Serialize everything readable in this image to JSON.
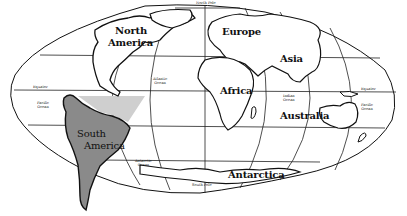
{
  "map": {
    "projection": "oval world map",
    "highlight_colors": {
      "south_america": "#8a8a8a",
      "atlantic_region": "#cfcfcf",
      "outline": "#111111",
      "background": "#ffffff"
    },
    "continent_labels": {
      "north_america_1": "North",
      "north_america_2": "America",
      "europe": "Europe",
      "asia": "Asia",
      "africa": "Africa",
      "australia": "Australia",
      "south_america_1": "South",
      "south_america_2": "America",
      "antarctica": "Antarctica"
    },
    "small_labels": {
      "north_pole": "North Pole",
      "south_pole": "South Pole",
      "equator_left": "Equator",
      "equator_right": "Equator",
      "pacific_left_1": "Pacific",
      "pacific_left_2": "Ocean",
      "pacific_right_1": "Pacific",
      "pacific_right_2": "Ocean",
      "atlantic_1": "Atlantic",
      "atlantic_2": "Ocean",
      "indian_1": "Indian",
      "indian_2": "Ocean",
      "antarctic_1": "Antarctic",
      "antarctic_2": "Ocean"
    }
  }
}
